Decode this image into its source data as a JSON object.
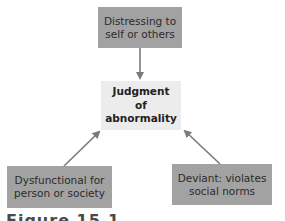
{
  "diagram": {
    "center": {
      "label_line1": "Judgment",
      "label_line2": "of",
      "label_line3": "abnormality"
    },
    "nodes": [
      {
        "id": "top",
        "line1": "Distressing to",
        "line2": "self or others"
      },
      {
        "id": "left",
        "line1": "Dysfunctional for",
        "line2": "person or society"
      },
      {
        "id": "right",
        "line1": "Deviant: violates",
        "line2": "social norms"
      }
    ],
    "caption": "Figure 15.1",
    "colors": {
      "outer_box": "#a2a2a2",
      "center_box": "#ececec",
      "arrow": "#7a7a7a"
    }
  }
}
